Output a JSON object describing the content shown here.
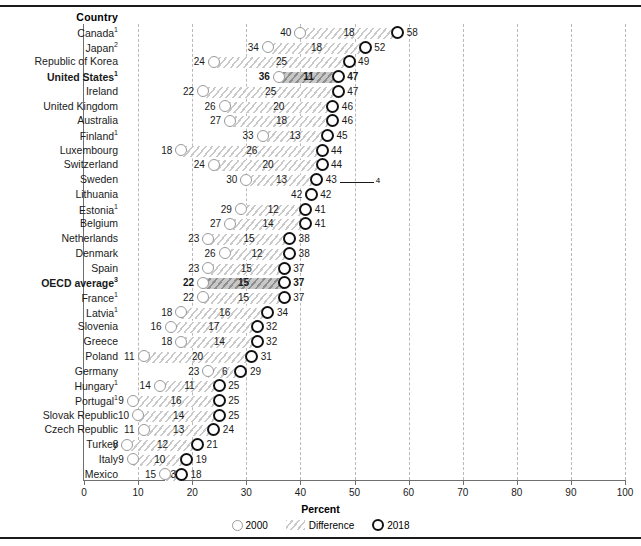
{
  "header": {
    "country_column": "Country"
  },
  "axis": {
    "xlabel": "Percent",
    "ticks": [
      0,
      10,
      20,
      30,
      40,
      50,
      60,
      70,
      80,
      90,
      100
    ],
    "xmin": 0,
    "xmax": 100
  },
  "legend": {
    "items": [
      {
        "key": "2000",
        "label": "2000",
        "icon": "open-circle-light"
      },
      {
        "key": "difference",
        "label": "Difference",
        "icon": "hatched-bar"
      },
      {
        "key": "2018",
        "label": "2018",
        "icon": "open-circle-bold"
      }
    ]
  },
  "annotations": {
    "sweden_lithuania_footnote": "4"
  },
  "chart_data": {
    "type": "bar",
    "title": "",
    "subtitle": "",
    "xlabel": "Percent",
    "ylabel": "Country",
    "xlim": [
      0,
      100
    ],
    "grid": true,
    "legend_position": "bottom",
    "series": [
      {
        "name": "2000",
        "marker": "open-circle-light"
      },
      {
        "name": "Difference",
        "marker": "hatched-bar"
      },
      {
        "name": "2018",
        "marker": "open-circle-bold"
      }
    ],
    "categories": [
      "Canada",
      "Japan",
      "Republic of Korea",
      "United States",
      "Ireland",
      "United Kingdom",
      "Australia",
      "Finland",
      "Luxembourg",
      "Switzerland",
      "Sweden",
      "Lithuania",
      "Estonia",
      "Belgium",
      "Netherlands",
      "Denmark",
      "Spain",
      "OECD average",
      "France",
      "Latvia",
      "Slovenia",
      "Greece",
      "Poland",
      "Germany",
      "Hungary",
      "Portugal",
      "Slovak Republic",
      "Czech Republic",
      "Turkey",
      "Italy",
      "Mexico"
    ],
    "rows": [
      {
        "country": "Canada",
        "footnote": "1",
        "v2000": 40,
        "diff": 18,
        "v2018": 58,
        "highlight": false
      },
      {
        "country": "Japan",
        "footnote": "2",
        "v2000": 34,
        "diff": 18,
        "v2018": 52,
        "highlight": false
      },
      {
        "country": "Republic of Korea",
        "footnote": "",
        "v2000": 24,
        "diff": 25,
        "v2018": 49,
        "highlight": false
      },
      {
        "country": "United States",
        "footnote": "1",
        "v2000": 36,
        "diff": 11,
        "v2018": 47,
        "highlight": true
      },
      {
        "country": "Ireland",
        "footnote": "",
        "v2000": 22,
        "diff": 25,
        "v2018": 47,
        "highlight": false
      },
      {
        "country": "United Kingdom",
        "footnote": "",
        "v2000": 26,
        "diff": 20,
        "v2018": 46,
        "highlight": false
      },
      {
        "country": "Australia",
        "footnote": "",
        "v2000": 27,
        "diff": 18,
        "v2018": 46,
        "highlight": false
      },
      {
        "country": "Finland",
        "footnote": "1",
        "v2000": 33,
        "diff": 13,
        "v2018": 45,
        "highlight": false
      },
      {
        "country": "Luxembourg",
        "footnote": "",
        "v2000": 18,
        "diff": 26,
        "v2018": 44,
        "highlight": false
      },
      {
        "country": "Switzerland",
        "footnote": "",
        "v2000": 24,
        "diff": 20,
        "v2018": 44,
        "highlight": false
      },
      {
        "country": "Sweden",
        "footnote": "",
        "v2000": 30,
        "diff": 13,
        "v2018": 43,
        "highlight": false
      },
      {
        "country": "Lithuania",
        "footnote": "",
        "v2000": 42,
        "diff": 0,
        "v2018": 42,
        "highlight": false
      },
      {
        "country": "Estonia",
        "footnote": "1",
        "v2000": 29,
        "diff": 12,
        "v2018": 41,
        "highlight": false
      },
      {
        "country": "Belgium",
        "footnote": "",
        "v2000": 27,
        "diff": 14,
        "v2018": 41,
        "highlight": false
      },
      {
        "country": "Netherlands",
        "footnote": "",
        "v2000": 23,
        "diff": 15,
        "v2018": 38,
        "highlight": false
      },
      {
        "country": "Denmark",
        "footnote": "",
        "v2000": 26,
        "diff": 12,
        "v2018": 38,
        "highlight": false
      },
      {
        "country": "Spain",
        "footnote": "",
        "v2000": 23,
        "diff": 15,
        "v2018": 37,
        "highlight": false
      },
      {
        "country": "OECD average",
        "footnote": "3",
        "v2000": 22,
        "diff": 15,
        "v2018": 37,
        "highlight": true
      },
      {
        "country": "France",
        "footnote": "1",
        "v2000": 22,
        "diff": 15,
        "v2018": 37,
        "highlight": false
      },
      {
        "country": "Latvia",
        "footnote": "1",
        "v2000": 18,
        "diff": 16,
        "v2018": 34,
        "highlight": false
      },
      {
        "country": "Slovenia",
        "footnote": "",
        "v2000": 16,
        "diff": 17,
        "v2018": 32,
        "highlight": false
      },
      {
        "country": "Greece",
        "footnote": "",
        "v2000": 18,
        "diff": 14,
        "v2018": 32,
        "highlight": false
      },
      {
        "country": "Poland",
        "footnote": "",
        "v2000": 11,
        "diff": 20,
        "v2018": 31,
        "highlight": false
      },
      {
        "country": "Germany",
        "footnote": "",
        "v2000": 23,
        "diff": 6,
        "v2018": 29,
        "highlight": false
      },
      {
        "country": "Hungary",
        "footnote": "1",
        "v2000": 14,
        "diff": 11,
        "v2018": 25,
        "highlight": false
      },
      {
        "country": "Portugal",
        "footnote": "1",
        "v2000": 9,
        "diff": 16,
        "v2018": 25,
        "highlight": false
      },
      {
        "country": "Slovak Republic",
        "footnote": "",
        "v2000": 10,
        "diff": 14,
        "v2018": 25,
        "highlight": false
      },
      {
        "country": "Czech Republic",
        "footnote": "",
        "v2000": 11,
        "diff": 13,
        "v2018": 24,
        "highlight": false
      },
      {
        "country": "Turkey",
        "footnote": "",
        "v2000": 8,
        "diff": 12,
        "v2018": 21,
        "highlight": false
      },
      {
        "country": "Italy",
        "footnote": "",
        "v2000": 9,
        "diff": 10,
        "v2018": 19,
        "highlight": false
      },
      {
        "country": "Mexico",
        "footnote": "",
        "v2000": 15,
        "diff": 3,
        "v2018": 18,
        "highlight": false
      }
    ]
  }
}
